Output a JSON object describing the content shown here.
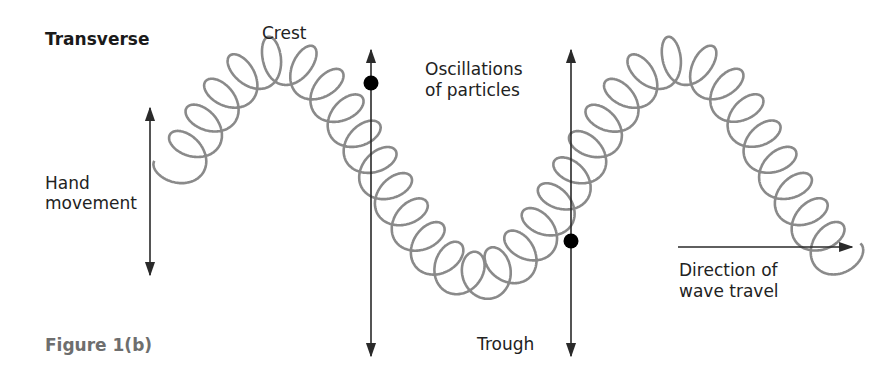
{
  "diagram": {
    "title": "Transverse",
    "figure_caption": "Figure 1(b)",
    "labels": {
      "crest": "Crest",
      "trough": "Trough",
      "hand_movement_line1": "Hand",
      "hand_movement_line2": "movement",
      "oscillations_line1": "Oscillations",
      "oscillations_line2": "of particles",
      "direction_line1": "Direction of",
      "direction_line2": "wave travel"
    },
    "colors": {
      "spring": "#8a8a8a",
      "arrow": "#2a2a2a",
      "particle": "#000000",
      "caption": "#6e6e6e"
    },
    "spring": {
      "x_start": 175,
      "x_end": 845,
      "center_y": 168,
      "amplitude": 108,
      "wavelength": 400,
      "coil_radius_x": 17,
      "coil_radius_y": 24,
      "coils": 34
    },
    "arrows": [
      {
        "name": "hand-movement-arrow",
        "x1": 150,
        "y1": 108,
        "x2": 150,
        "y2": 275,
        "heads": "both"
      },
      {
        "name": "oscillation-arrow-left",
        "x1": 371,
        "y1": 50,
        "x2": 371,
        "y2": 356,
        "heads": "both"
      },
      {
        "name": "oscillation-arrow-right",
        "x1": 571,
        "y1": 50,
        "x2": 571,
        "y2": 356,
        "heads": "both"
      },
      {
        "name": "direction-of-travel-arrow",
        "x1": 678,
        "y1": 247,
        "x2": 852,
        "y2": 247,
        "heads": "end"
      }
    ],
    "particles": [
      {
        "name": "particle-at-crest-side",
        "cx": 371,
        "cy": 83,
        "r": 7.5
      },
      {
        "name": "particle-at-trough-side",
        "cx": 571,
        "cy": 241,
        "r": 7.5
      }
    ]
  }
}
